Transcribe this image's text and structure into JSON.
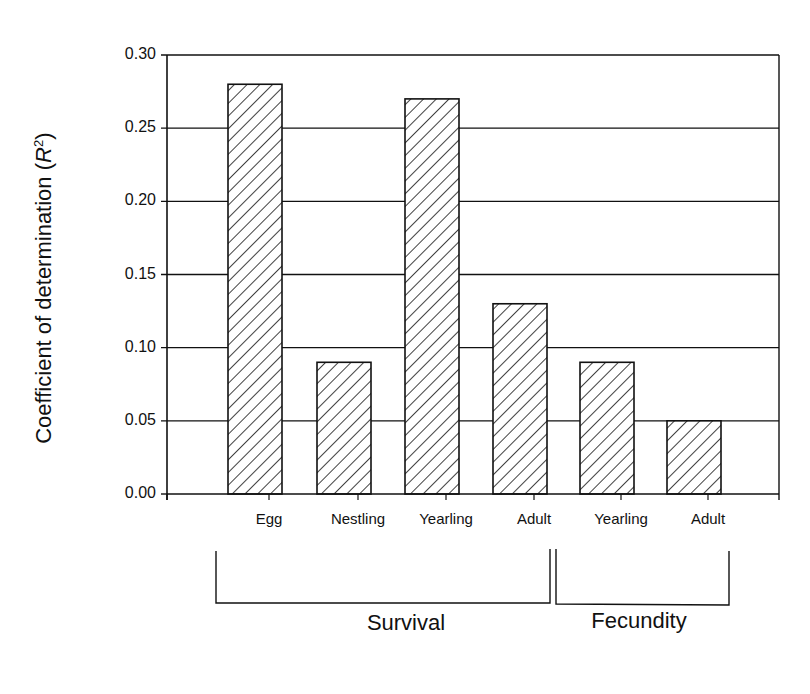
{
  "chart_data": {
    "type": "bar",
    "title": "",
    "xlabel": "",
    "ylabel": "Coefficient of determination (R²)",
    "ylabel_parts": {
      "main": "Coefficient of determination (",
      "var": "R",
      "sup": "2",
      "close": ")"
    },
    "ylim": [
      0,
      0.3
    ],
    "yticks": [
      "0.00",
      "0.05",
      "0.10",
      "0.15",
      "0.20",
      "0.25",
      "0.30"
    ],
    "grid": true,
    "legend": null,
    "categories": [
      "Egg",
      "Nestling",
      "Yearling",
      "Adult",
      "Yearling",
      "Adult"
    ],
    "groups": [
      {
        "name": "Survival",
        "categories": [
          "Egg",
          "Nestling",
          "Yearling",
          "Adult"
        ]
      },
      {
        "name": "Fecundity",
        "categories": [
          "Yearling",
          "Adult"
        ]
      }
    ],
    "values": [
      0.28,
      0.09,
      0.27,
      0.13,
      0.09,
      0.05
    ],
    "bar_fill": "diagonal hatch",
    "colors": {
      "line": "#111111",
      "background": "#ffffff"
    }
  }
}
